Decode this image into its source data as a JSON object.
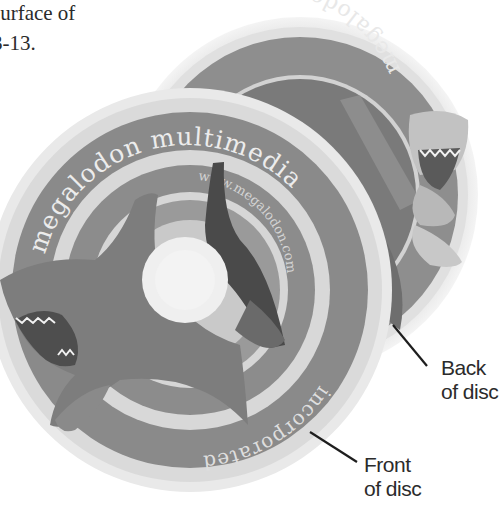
{
  "caption": {
    "line1": "surface of",
    "line2": "3-13."
  },
  "figure": {
    "back_disc": {
      "label_line1": "Back",
      "label_line2": "of disc",
      "ring_text": "megalodon"
    },
    "front_disc": {
      "label_line1": "Front",
      "label_line2": "of disc",
      "ring_text_top": "megalodon multimedia",
      "ring_text_bottom": "incorporated",
      "url_text": "www.megalodon.com"
    },
    "colors": {
      "background": "#ffffff",
      "disc_edge": "#e4e4e4",
      "ring_dark": "#8a8a8a",
      "ring_light": "#d9d9d9",
      "shark_body": "#7c7c7c",
      "shark_dark": "#4a4a4a",
      "hub": "#ececec",
      "text": "#2b2b2b",
      "leader_line": "#1e1e1e"
    }
  }
}
